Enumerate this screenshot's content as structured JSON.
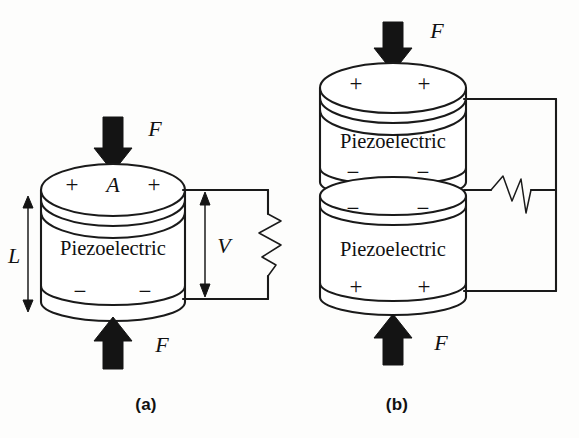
{
  "figure": {
    "background_color": "#fdfdfc",
    "ink_color": "#141414",
    "panels": [
      {
        "id": "a",
        "caption": "(a)",
        "description": "Single piezoelectric disc under compressive force generating voltage V across a load",
        "material_label": "Piezoelectric",
        "force_top_label": "F",
        "force_bottom_label": "F",
        "area_label": "A",
        "length_label": "L",
        "voltage_label": "V",
        "top_face_signs": [
          "+",
          "+"
        ],
        "bottom_face_signs": [
          "−",
          "−"
        ],
        "circuit_element": "resistor"
      },
      {
        "id": "b",
        "caption": "(b)",
        "description": "Two stacked piezoelectric discs in parallel connection under compressive force driving a resistor",
        "material_label_upper": "Piezoelectric",
        "material_label_lower": "Piezoelectric",
        "force_top_label": "F",
        "force_bottom_label": "F",
        "top_face_signs": [
          "+",
          "+"
        ],
        "middle_upper_signs": [
          "−",
          "−"
        ],
        "middle_lower_signs": [
          "−",
          "−"
        ],
        "bottom_face_signs": [
          "+",
          "+"
        ],
        "circuit_element": "resistor"
      }
    ]
  }
}
